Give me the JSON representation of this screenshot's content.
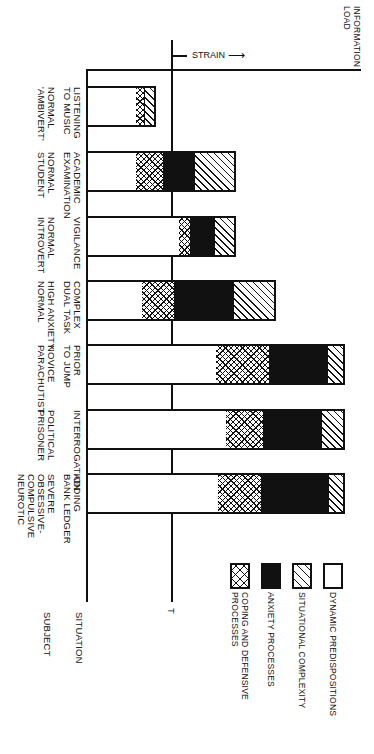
{
  "chart_data": {
    "type": "bar",
    "orientation": "horizontal-stacked (rotated figure)",
    "title": "",
    "axis_labels": {
      "x": "INFORMATION LOAD",
      "threshold_marker": "T",
      "strain_label": "STRAIN",
      "row_axis_situation": "SITUATION",
      "row_axis_subject": "SUBJECT"
    },
    "legend": [
      {
        "key": "dynamic",
        "label": "DYNAMIC PREDISPOSITIONS",
        "pattern": "white"
      },
      {
        "key": "situational",
        "label": "SITUATIONAL COMPLEXITY",
        "pattern": "diagonal"
      },
      {
        "key": "anxiety",
        "label": "ANXIETY PROCESSES",
        "pattern": "black"
      },
      {
        "key": "coping",
        "label": "COPING AND DEFENSIVE PROCESSES",
        "pattern": "crosshatch"
      }
    ],
    "units": "relative pixel length along information load axis (T threshold at 85)",
    "threshold_T": 85,
    "categories": [
      {
        "situation": "LISTENING TO MUSIC",
        "subject": "NORMAL 'AMBIVERT'"
      },
      {
        "situation": "ACADEMIC EXAMINATION",
        "subject": "NORMAL STUDENT"
      },
      {
        "situation": "VIGILANCE",
        "subject": "NORMAL INTROVERT"
      },
      {
        "situation": "COMPLEX DUAL TASK",
        "subject": "HIGH ANXIETY NORMAL"
      },
      {
        "situation": "PRIOR TO JUMP",
        "subject": "NOVICE PARACHUTIST"
      },
      {
        "situation": "INTERROGATION",
        "subject": "POLITICAL PRISONER"
      },
      {
        "situation": "ADDING BANK LEDGER",
        "subject": "SEVERE OBSESSIVE-COMPULSIVE NEUROTIC"
      }
    ],
    "series": [
      {
        "name": "DYNAMIC PREDISPOSITIONS",
        "values": [
          48,
          48,
          91,
          54,
          128,
          138,
          130
        ]
      },
      {
        "name": "COPING AND DEFENSIVE PROCESSES",
        "values": [
          8,
          27,
          11,
          32,
          53,
          37,
          43
        ]
      },
      {
        "name": "ANXIETY PROCESSES",
        "values": [
          0,
          31,
          24,
          59,
          58,
          58,
          67
        ]
      },
      {
        "name": "SITUATIONAL COMPLEXITY",
        "values": [
          10,
          40,
          20,
          41,
          16,
          22,
          15
        ]
      }
    ]
  },
  "labels": {
    "information_load": [
      "INFORMATION",
      "LOAD"
    ],
    "strain": "STRAIN",
    "t_marker": "T",
    "situation": "SITUATION",
    "subject": "SUBJECT"
  },
  "rows": [
    {
      "situation": "LISTENING\nTO MUSIC",
      "subject": "NORMAL\n'AMBIVERT'",
      "segs": [
        48,
        8,
        0,
        10
      ]
    },
    {
      "situation": "ACADEMIC\nEXAMINATION",
      "subject": "NORMAL\nSTUDENT",
      "segs": [
        48,
        27,
        31,
        40
      ]
    },
    {
      "situation": "VIGILANCE",
      "subject": "NORMAL\nINTROVERT",
      "segs": [
        91,
        11,
        24,
        20
      ]
    },
    {
      "situation": "COMPLEX\nDUAL TASK",
      "subject": "HIGH ANXIETY\nNORMAL",
      "segs": [
        54,
        32,
        59,
        41
      ]
    },
    {
      "situation": "PRIOR\nTO JUMP",
      "subject": "NOVICE\nPARACHUTIST",
      "segs": [
        128,
        53,
        58,
        16
      ]
    },
    {
      "situation": "INTERROGATION",
      "subject": "POLITICAL\nPRISONER",
      "segs": [
        138,
        37,
        58,
        22
      ]
    },
    {
      "situation": "ADDING\nBANK LEDGER",
      "subject": "SEVERE\nOBSESSIVE-\nCOMPULSIVE\nNEUROTIC",
      "segs": [
        130,
        43,
        67,
        15
      ]
    }
  ],
  "legend": {
    "dynamic": "DYNAMIC PREDISPOSITIONS",
    "situational": "SITUATIONAL COMPLEXITY",
    "anxiety": "ANXIETY PROCESSES",
    "coping": "COPING AND DEFENSIVE\nPROCESSES"
  }
}
